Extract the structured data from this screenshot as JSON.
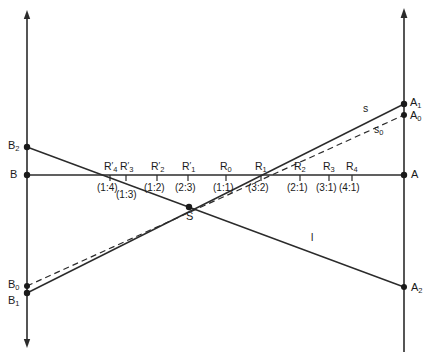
{
  "figure": {
    "stroke_color": "#2b2b2b",
    "text_color": "#1a1a1a",
    "background": "#ffffff"
  },
  "axes": {
    "left_axis": {
      "name": "left-vertical-line",
      "x": 27,
      "y_top": 12,
      "y_bottom": 346
    },
    "right_axis": {
      "name": "right-vertical-line",
      "x": 404,
      "y_top": 10,
      "y_bottom": 352
    },
    "base_line": {
      "name": "horizontal-base-line",
      "y": 175,
      "x_left": 27,
      "x_right": 404
    }
  },
  "points": {
    "B": {
      "label": "B",
      "sub": "",
      "x": 27,
      "y": 175,
      "label_x": 10,
      "label_y": 169
    },
    "B0": {
      "label": "B",
      "sub": "0",
      "x": 27,
      "y": 286,
      "label_x": 8,
      "label_y": 279
    },
    "B1": {
      "label": "B",
      "sub": "1",
      "x": 27,
      "y": 293,
      "label_x": 8,
      "label_y": 295
    },
    "B2": {
      "label": "B",
      "sub": "2",
      "x": 27,
      "y": 147,
      "label_x": 8,
      "label_y": 140
    },
    "A": {
      "label": "A",
      "sub": "",
      "x": 404,
      "y": 175,
      "label_x": 411,
      "label_y": 169
    },
    "A0": {
      "label": "A",
      "sub": "0",
      "x": 404,
      "y": 115,
      "label_x": 410,
      "label_y": 110
    },
    "A1": {
      "label": "A",
      "sub": "1",
      "x": 404,
      "y": 104,
      "label_x": 410,
      "label_y": 98
    },
    "A2": {
      "label": "A",
      "sub": "2",
      "x": 404,
      "y": 287,
      "label_x": 411,
      "label_y": 283
    },
    "S": {
      "label": "S",
      "sub": "",
      "x": 189,
      "y": 207,
      "label_x": 186,
      "label_y": 211
    }
  },
  "line_labels": {
    "s": {
      "text": "s",
      "sub": "",
      "x": 363,
      "y": 103
    },
    "s0": {
      "text": "s",
      "sub": "0",
      "x": 374,
      "y": 125
    },
    "l": {
      "text": "l",
      "sub": "",
      "x": 311,
      "y": 232
    }
  },
  "scale": {
    "tick_y_top": 175,
    "tick_y_bottom": 180,
    "marks": [
      {
        "id": "Rp4",
        "base": "R",
        "prime": true,
        "sub": "4",
        "ratio": "(1:4)",
        "x": 110,
        "label_y": 161,
        "ratio_y": 183,
        "ratio_offset_x": -13
      },
      {
        "id": "Rp3",
        "base": "R",
        "prime": true,
        "sub": "3",
        "ratio": "(1:3)",
        "x": 126,
        "label_y": 161,
        "ratio_y": 190,
        "ratio_offset_x": -10
      },
      {
        "id": "Rp2",
        "base": "R",
        "prime": true,
        "sub": "2",
        "ratio": "(1:2)",
        "x": 157,
        "label_y": 161,
        "ratio_y": 183,
        "ratio_offset_x": -13
      },
      {
        "id": "Rp1",
        "base": "R",
        "prime": true,
        "sub": "1",
        "ratio": "(2:3)",
        "x": 188,
        "label_y": 161,
        "ratio_y": 183,
        "ratio_offset_x": -13
      },
      {
        "id": "R0",
        "base": "R",
        "prime": false,
        "sub": "0",
        "ratio": "(1:1)",
        "x": 226,
        "label_y": 161,
        "ratio_y": 183,
        "ratio_offset_x": -13
      },
      {
        "id": "R1",
        "base": "R",
        "prime": false,
        "sub": "1",
        "ratio": "(3:2)",
        "x": 261,
        "label_y": 161,
        "ratio_y": 183,
        "ratio_offset_x": -13
      },
      {
        "id": "R2",
        "base": "R",
        "prime": false,
        "sub": "2",
        "ratio": "(2:1)",
        "x": 300,
        "label_y": 161,
        "ratio_y": 183,
        "ratio_offset_x": -13
      },
      {
        "id": "R3",
        "base": "R",
        "prime": false,
        "sub": "3",
        "ratio": "(3:1)",
        "x": 329,
        "label_y": 161,
        "ratio_y": 183,
        "ratio_offset_x": -13
      },
      {
        "id": "R4",
        "base": "R",
        "prime": false,
        "sub": "4",
        "ratio": "(4:1)",
        "x": 352,
        "label_y": 161,
        "ratio_y": 183,
        "ratio_offset_x": -13
      }
    ]
  },
  "segments": {
    "s_line": {
      "from": "B1",
      "to": "A1",
      "style": "solid",
      "x1": 27,
      "y1": 293,
      "x2": 404,
      "y2": 104
    },
    "s0_line": {
      "from": "B0",
      "to": "A0",
      "style": "dashed",
      "x1": 27,
      "y1": 286,
      "x2": 404,
      "y2": 115
    },
    "l_line": {
      "from": "B2",
      "to": "A2",
      "style": "solid",
      "x1": 27,
      "y1": 147,
      "x2": 404,
      "y2": 287
    }
  }
}
